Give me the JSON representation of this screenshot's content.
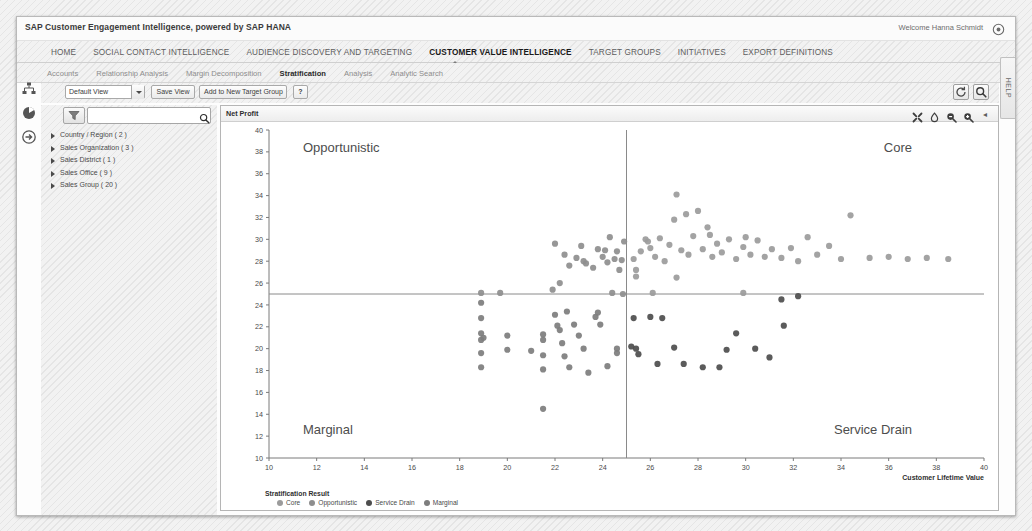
{
  "brand": "SAP Customer Engagement Intelligence, powered by SAP HANA",
  "user": {
    "welcome": "Welcome Hanna Schmidt",
    "gear_icon": "gear-icon"
  },
  "main_nav": [
    {
      "label": "HOME",
      "active": false
    },
    {
      "label": "SOCIAL CONTACT INTELLIGENCE",
      "active": false
    },
    {
      "label": "AUDIENCE DISCOVERY AND TARGETING",
      "active": false
    },
    {
      "label": "CUSTOMER VALUE INTELLIGENCE",
      "active": true
    },
    {
      "label": "TARGET GROUPS",
      "active": false
    },
    {
      "label": "INITIATIVES",
      "active": false
    },
    {
      "label": "EXPORT DEFINITIONS",
      "active": false
    }
  ],
  "sub_nav": [
    {
      "label": "Accounts",
      "active": false
    },
    {
      "label": "Relationship Analysis",
      "active": false
    },
    {
      "label": "Margin Decomposition",
      "active": false
    },
    {
      "label": "Stratification",
      "active": true
    },
    {
      "label": "Analysis",
      "active": false
    },
    {
      "label": "Analytic Search",
      "active": false
    }
  ],
  "rail": [
    {
      "icon": "org-hierarchy-icon"
    },
    {
      "icon": "globe-segment-icon"
    },
    {
      "icon": "sign-in-arrow-icon"
    }
  ],
  "toolbar": {
    "view_select_value": "Default View",
    "save_view_label": "Save View",
    "add_target_group_label": "Add to New Target Group",
    "help_label": "?",
    "refresh_icon": "refresh-icon",
    "search_icon": "search-icon"
  },
  "filter": {
    "filter_icon": "funnel-icon",
    "search_value": "",
    "search_placeholder": "",
    "search_icon": "search-icon",
    "collapse_icon": "chevron-left-icon",
    "tree": [
      {
        "label": "Country / Region ( 2 )"
      },
      {
        "label": "Sales Organization ( 3 )"
      },
      {
        "label": "Sales District ( 1 )"
      },
      {
        "label": "Sales Office ( 9 )"
      },
      {
        "label": "Sales Group ( 20 )"
      }
    ]
  },
  "chart_panel": {
    "title": "Net Profit",
    "tools": [
      {
        "icon": "expand-fullscreen-icon"
      },
      {
        "icon": "pin-icon"
      },
      {
        "icon": "zoom-out-icon"
      },
      {
        "icon": "zoom-in-icon"
      },
      {
        "icon": "chevron-left-icon",
        "glyph": "◂"
      }
    ]
  },
  "help_tab": {
    "label": "HELP"
  },
  "colors": {
    "core": "#9b9b9b",
    "opportunistic": "#8e8e8e",
    "service_drain": "#4d4d4d",
    "marginal": "#7d7d7d",
    "axis": "#7a7a7a",
    "reference_line": "#8a8a8a"
  },
  "chart_data": {
    "type": "scatter",
    "title": "Net Profit",
    "xlabel": "Customer Lifetime Value",
    "ylabel": "Net Profit",
    "xlim": [
      10,
      40
    ],
    "ylim": [
      10,
      40
    ],
    "xticks": [
      10,
      12,
      14,
      16,
      18,
      20,
      22,
      24,
      26,
      28,
      30,
      32,
      34,
      36,
      38,
      40
    ],
    "yticks": [
      10,
      12,
      14,
      16,
      18,
      20,
      22,
      24,
      26,
      28,
      30,
      32,
      34,
      36,
      38,
      40
    ],
    "grid": false,
    "reference_lines": {
      "x": 25,
      "y": 25
    },
    "quadrant_labels": {
      "top_left": "Opportunistic",
      "top_right": "Core",
      "bottom_left": "Marginal",
      "bottom_right": "Service Drain"
    },
    "legend": {
      "title": "Stratification Result",
      "position": "bottom-left",
      "entries": [
        "Core",
        "Opportunistic",
        "Service Drain",
        "Marginal"
      ]
    },
    "series": [
      {
        "name": "Opportunistic",
        "color": "#8e8e8e",
        "points": [
          [
            22.0,
            29.6
          ],
          [
            22.4,
            28.6
          ],
          [
            22.6,
            27.6
          ],
          [
            22.9,
            28.3
          ],
          [
            23.1,
            29.4
          ],
          [
            23.3,
            27.8
          ],
          [
            23.6,
            27.4
          ],
          [
            23.8,
            29.1
          ],
          [
            24.0,
            28.4
          ],
          [
            24.2,
            27.9
          ],
          [
            24.3,
            30.2
          ],
          [
            24.5,
            28.2
          ],
          [
            24.6,
            28.9
          ],
          [
            24.7,
            27.2
          ],
          [
            24.8,
            28.1
          ],
          [
            24.9,
            29.8
          ],
          [
            24.4,
            25.1
          ],
          [
            24.85,
            25.0
          ],
          [
            22.2,
            26.0
          ],
          [
            18.9,
            25.1
          ],
          [
            19.7,
            25.1
          ],
          [
            21.9,
            25.4
          ],
          [
            23.2,
            28.0
          ],
          [
            24.1,
            29.0
          ]
        ]
      },
      {
        "name": "Core",
        "color": "#9b9b9b",
        "points": [
          [
            25.3,
            28.2
          ],
          [
            25.6,
            28.9
          ],
          [
            25.8,
            30.0
          ],
          [
            26.0,
            29.2
          ],
          [
            26.2,
            28.4
          ],
          [
            26.4,
            30.1
          ],
          [
            26.6,
            28.0
          ],
          [
            26.8,
            29.5
          ],
          [
            27.0,
            31.8
          ],
          [
            27.1,
            34.1
          ],
          [
            27.3,
            29.0
          ],
          [
            27.5,
            32.3
          ],
          [
            27.6,
            28.6
          ],
          [
            27.8,
            30.3
          ],
          [
            28.0,
            32.6
          ],
          [
            28.2,
            29.1
          ],
          [
            28.4,
            31.1
          ],
          [
            28.6,
            28.4
          ],
          [
            28.8,
            29.6
          ],
          [
            29.0,
            28.8
          ],
          [
            29.3,
            30.0
          ],
          [
            29.6,
            28.2
          ],
          [
            29.9,
            29.3
          ],
          [
            30.2,
            28.6
          ],
          [
            30.5,
            29.9
          ],
          [
            30.8,
            28.4
          ],
          [
            31.1,
            29.1
          ],
          [
            31.5,
            28.3
          ],
          [
            31.9,
            29.2
          ],
          [
            32.2,
            28.0
          ],
          [
            32.6,
            30.2
          ],
          [
            33.0,
            28.6
          ],
          [
            33.5,
            29.4
          ],
          [
            34.0,
            28.2
          ],
          [
            34.4,
            32.2
          ],
          [
            35.2,
            28.3
          ],
          [
            36.0,
            28.4
          ],
          [
            36.8,
            28.2
          ],
          [
            37.6,
            28.3
          ],
          [
            38.5,
            28.2
          ],
          [
            26.1,
            25.1
          ],
          [
            29.9,
            25.1
          ],
          [
            25.4,
            26.6
          ],
          [
            25.4,
            27.2
          ],
          [
            27.1,
            26.5
          ],
          [
            25.9,
            29.8
          ],
          [
            28.5,
            30.4
          ],
          [
            30.0,
            30.2
          ]
        ]
      },
      {
        "name": "Marginal",
        "color": "#7d7d7d",
        "points": [
          [
            18.9,
            24.2
          ],
          [
            18.9,
            22.8
          ],
          [
            18.9,
            21.4
          ],
          [
            18.9,
            20.8
          ],
          [
            18.9,
            19.6
          ],
          [
            18.9,
            18.3
          ],
          [
            19.0,
            21.0
          ],
          [
            20.0,
            21.2
          ],
          [
            21.5,
            21.3
          ],
          [
            21.5,
            20.8
          ],
          [
            21.5,
            19.4
          ],
          [
            21.5,
            18.1
          ],
          [
            21.5,
            14.5
          ],
          [
            22.0,
            23.1
          ],
          [
            22.1,
            22.1
          ],
          [
            22.2,
            21.7
          ],
          [
            22.3,
            20.5
          ],
          [
            22.4,
            19.3
          ],
          [
            22.6,
            18.3
          ],
          [
            22.8,
            22.2
          ],
          [
            23.0,
            21.2
          ],
          [
            23.2,
            20.0
          ],
          [
            23.4,
            17.8
          ],
          [
            23.7,
            22.9
          ],
          [
            23.8,
            23.3
          ],
          [
            23.9,
            22.2
          ],
          [
            24.2,
            18.4
          ],
          [
            20.0,
            19.9
          ],
          [
            21.0,
            19.8
          ],
          [
            22.5,
            23.4
          ],
          [
            24.6,
            20.0
          ],
          [
            24.6,
            19.6
          ]
        ]
      },
      {
        "name": "Service Drain",
        "color": "#4d4d4d",
        "points": [
          [
            25.3,
            22.8
          ],
          [
            25.4,
            20.0
          ],
          [
            25.5,
            19.5
          ],
          [
            26.0,
            22.9
          ],
          [
            26.3,
            18.6
          ],
          [
            27.0,
            20.1
          ],
          [
            27.4,
            18.6
          ],
          [
            28.2,
            18.3
          ],
          [
            28.9,
            18.3
          ],
          [
            29.6,
            21.4
          ],
          [
            30.4,
            20.0
          ],
          [
            31.0,
            19.2
          ],
          [
            31.5,
            24.5
          ],
          [
            32.2,
            24.8
          ],
          [
            31.6,
            22.1
          ],
          [
            26.5,
            22.8
          ],
          [
            29.2,
            19.9
          ],
          [
            25.2,
            20.2
          ]
        ]
      }
    ]
  }
}
